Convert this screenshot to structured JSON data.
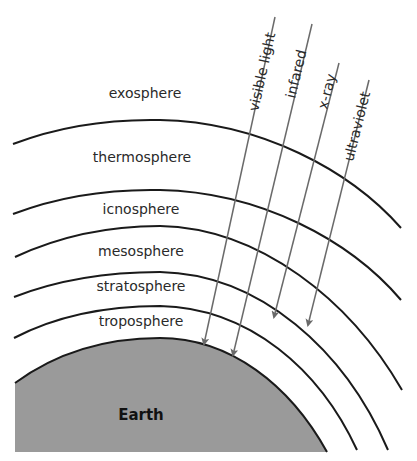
{
  "diagram": {
    "layers": [
      {
        "name": "exosphere"
      },
      {
        "name": "thermosphere"
      },
      {
        "name": "icnosphere"
      },
      {
        "name": "mesosphere"
      },
      {
        "name": "stratosphere"
      },
      {
        "name": "troposphere"
      }
    ],
    "earth_label": "Earth",
    "rays": [
      {
        "name": "visible light",
        "reaches": "Earth surface"
      },
      {
        "name": "infared",
        "reaches": "Earth surface"
      },
      {
        "name": "x-ray",
        "reaches": "stratosphere"
      },
      {
        "name": "ultraviolet",
        "reaches": "stratosphere"
      }
    ],
    "colors": {
      "earth_fill": "#9a9a9a",
      "boundary_line": "#1a1a1a",
      "ray_line": "#6a6a6a",
      "background": "#ffffff"
    }
  }
}
